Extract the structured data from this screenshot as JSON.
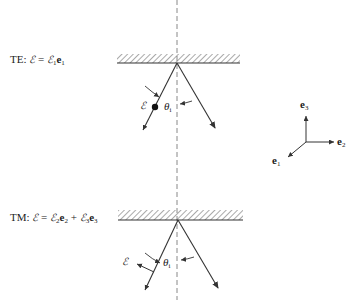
{
  "diagram": {
    "te": {
      "label": "TE:",
      "equation_lhs": "ℰ",
      "equation_eq": "=",
      "equation_rhs_field": "ℰ",
      "equation_rhs_sub": "1",
      "equation_rhs_vec": "e",
      "equation_rhs_vec_sub": "1",
      "field_label": "ℰ",
      "angle_label": "θ",
      "angle_sub": "i"
    },
    "tm": {
      "label": "TM:",
      "equation_lhs": "ℰ",
      "equation_eq": "=",
      "term1_field": "ℰ",
      "term1_sub": "2",
      "term1_vec": "e",
      "term1_vec_sub": "2",
      "plus": "+",
      "term2_field": "ℰ",
      "term2_sub": "3",
      "term2_vec": "e",
      "term2_vec_sub": "3",
      "field_label": "ℰ",
      "angle_label": "θ",
      "angle_sub": "i"
    },
    "axes": {
      "e3": "e",
      "e3_sub": "3",
      "e2": "e",
      "e2_sub": "2",
      "e1": "e",
      "e1_sub": "1"
    },
    "colors": {
      "ink": "#333333",
      "dashed_normal": "#888888"
    }
  }
}
